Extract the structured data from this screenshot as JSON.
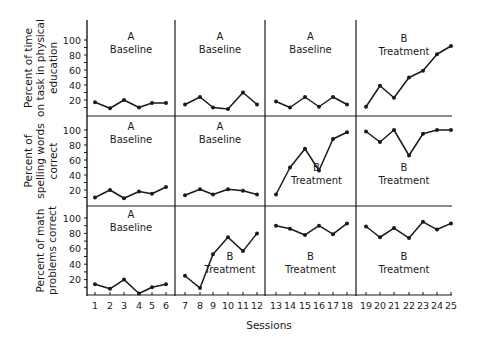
{
  "chart_data": {
    "type": "line",
    "title": "",
    "xlabel": "Sessions",
    "x": [
      1,
      2,
      3,
      4,
      5,
      6,
      7,
      8,
      9,
      10,
      11,
      12,
      13,
      14,
      15,
      16,
      17,
      18,
      19,
      20,
      21,
      22,
      23,
      24,
      25
    ],
    "x_tick_labels": [
      "1",
      "2",
      "3",
      "4",
      "5",
      "6",
      "7",
      "8",
      "9",
      "10",
      "11",
      "12",
      "13",
      "14",
      "15",
      "16",
      "17",
      "18",
      "19",
      "20",
      "21",
      "22",
      "23",
      "24",
      "25"
    ],
    "phase_dividers_after_session": [
      6.5,
      12.5,
      18.5
    ],
    "grid": false,
    "legend": null,
    "panels": [
      {
        "ylabel_lines": [
          "Percent of time",
          "on task in physical",
          "education"
        ],
        "y_tick_labels": [
          "20",
          "40",
          "60",
          "80",
          "100"
        ],
        "ylim": [
          0,
          100
        ],
        "phases": [
          {
            "letter": "A",
            "label": "Baseline",
            "sessions": [
              1,
              6
            ]
          },
          {
            "letter": "A",
            "label": "Baseline",
            "sessions": [
              7,
              12
            ]
          },
          {
            "letter": "A",
            "label": "Baseline",
            "sessions": [
              13,
              18
            ]
          },
          {
            "letter": "B",
            "label": "Treatment",
            "sessions": [
              19,
              25
            ]
          }
        ],
        "segments": [
          [
            17,
            9,
            20,
            10,
            16,
            16
          ],
          [
            14,
            24,
            10,
            8,
            30,
            14
          ],
          [
            18,
            10,
            24,
            11,
            24,
            14
          ],
          [
            11,
            39,
            23,
            50,
            59,
            81,
            92
          ]
        ]
      },
      {
        "ylabel_lines": [
          "Percent of",
          "spelling words",
          "correct"
        ],
        "y_tick_labels": [
          "20",
          "40",
          "60",
          "80",
          "100"
        ],
        "ylim": [
          0,
          100
        ],
        "phases": [
          {
            "letter": "A",
            "label": "Baseline",
            "sessions": [
              1,
              6
            ]
          },
          {
            "letter": "A",
            "label": "Baseline",
            "sessions": [
              7,
              12
            ]
          },
          {
            "letter": "B",
            "label": "Treatment",
            "sessions": [
              13,
              18
            ]
          },
          {
            "letter": "B",
            "label": "Treatment",
            "sessions": [
              19,
              25
            ]
          }
        ],
        "segments": [
          [
            10,
            20,
            9,
            18,
            15,
            24
          ],
          [
            13,
            21,
            14,
            21,
            19,
            14
          ],
          [
            14,
            50,
            75,
            46,
            88,
            97
          ],
          [
            98,
            84,
            100,
            66,
            95,
            100,
            100
          ]
        ]
      },
      {
        "ylabel_lines": [
          "Percent of math",
          "problems correct"
        ],
        "y_tick_labels": [
          "20",
          "40",
          "60",
          "80",
          "100"
        ],
        "ylim": [
          0,
          100
        ],
        "phases": [
          {
            "letter": "A",
            "label": "Baseline",
            "sessions": [
              1,
              6
            ]
          },
          {
            "letter": "B",
            "label": "Treatment",
            "sessions": [
              7,
              12
            ]
          },
          {
            "letter": "B",
            "label": "Treatment",
            "sessions": [
              13,
              18
            ]
          },
          {
            "letter": "B",
            "label": "Treatment",
            "sessions": [
              19,
              25
            ]
          }
        ],
        "segments": [
          [
            14,
            8,
            20,
            2,
            10,
            14
          ],
          [
            25,
            9,
            53,
            75,
            57,
            80
          ],
          [
            90,
            86,
            78,
            90,
            79,
            93
          ],
          [
            89,
            75,
            87,
            74,
            95,
            85,
            93
          ]
        ]
      }
    ]
  }
}
